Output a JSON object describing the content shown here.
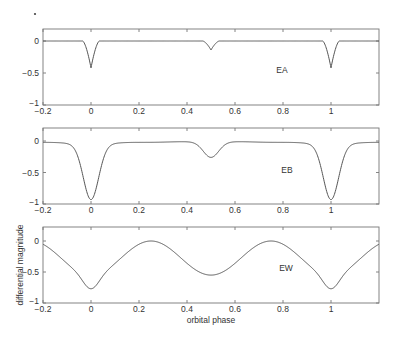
{
  "chart_data": [
    {
      "type": "line",
      "label": "EA",
      "title": "",
      "xlabel": "",
      "ylabel": "",
      "xlim": [
        -0.2,
        1.2
      ],
      "ylim": [
        -1,
        0.2
      ],
      "xticks": [
        "-0.2",
        "0",
        "0.2",
        "0.4",
        "0.6",
        "0.8",
        "1"
      ],
      "yticks": [
        "0",
        "-0.5",
        "-1"
      ],
      "eclipses": [
        {
          "phase": 0.0,
          "depth": 0.42,
          "halfwidth": 0.035,
          "shape": "sharp"
        },
        {
          "phase": 0.5,
          "depth": 0.14,
          "halfwidth": 0.035,
          "shape": "sharp"
        },
        {
          "phase": 1.0,
          "depth": 0.42,
          "halfwidth": 0.035,
          "shape": "sharp"
        }
      ],
      "x": [
        -0.2,
        -0.04,
        0.0,
        0.04,
        0.46,
        0.5,
        0.54,
        0.96,
        1.0,
        1.04,
        1.2
      ],
      "y": [
        0,
        0,
        -0.42,
        0,
        0,
        -0.14,
        0,
        0,
        -0.42,
        0,
        0
      ]
    },
    {
      "type": "line",
      "label": "EB",
      "title": "",
      "xlabel": "",
      "ylabel": "",
      "xlim": [
        -0.2,
        1.2
      ],
      "ylim": [
        -1,
        0.2
      ],
      "xticks": [
        "-0.2",
        "0",
        "0.2",
        "0.4",
        "0.6",
        "0.8",
        "1"
      ],
      "yticks": [
        "0",
        "-0.5",
        "-1"
      ],
      "x": [
        -0.2,
        -0.1,
        -0.05,
        0.0,
        0.05,
        0.1,
        0.25,
        0.4,
        0.5,
        0.6,
        0.75,
        0.9,
        0.95,
        1.0,
        1.05,
        1.1,
        1.2
      ],
      "y": [
        -0.02,
        -0.08,
        -0.4,
        -0.9,
        -0.4,
        -0.08,
        0.0,
        -0.05,
        -0.27,
        -0.05,
        0.0,
        -0.08,
        -0.4,
        -0.9,
        -0.4,
        -0.08,
        -0.02
      ]
    },
    {
      "type": "line",
      "label": "EW",
      "title": "",
      "xlabel": "orbital phase",
      "ylabel": "differential magnitude",
      "xlim": [
        -0.2,
        1.2
      ],
      "ylim": [
        -1,
        0.2
      ],
      "xticks": [
        "-0.2",
        "0",
        "0.2",
        "0.4",
        "0.6",
        "0.8",
        "1"
      ],
      "yticks": [
        "0",
        "-0.5",
        "-1"
      ],
      "x": [
        -0.2,
        -0.1,
        -0.05,
        0.0,
        0.05,
        0.1,
        0.25,
        0.4,
        0.47,
        0.5,
        0.53,
        0.6,
        0.75,
        0.9,
        0.95,
        1.0,
        1.05,
        1.1,
        1.2
      ],
      "y": [
        -0.02,
        -0.25,
        -0.5,
        -0.75,
        -0.5,
        -0.25,
        0.0,
        -0.22,
        -0.66,
        -0.66,
        -0.66,
        -0.22,
        0.0,
        -0.25,
        -0.5,
        -0.75,
        -0.5,
        -0.25,
        -0.02
      ]
    }
  ],
  "labels": {
    "panel1": "EA",
    "panel2": "EB",
    "panel3": "EW",
    "xlabel": "orbital phase",
    "ylabel": "differential magnitude"
  },
  "ticks": {
    "x": [
      "-0.2",
      "0",
      "0.2",
      "0.4",
      "0.6",
      "0.8",
      "1"
    ],
    "y": [
      "0",
      "-0.5",
      "-1"
    ]
  }
}
